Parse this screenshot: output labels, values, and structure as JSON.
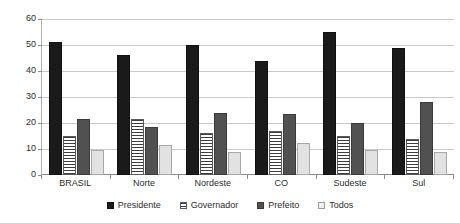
{
  "chart_data": {
    "type": "bar",
    "title": "",
    "subtitle": "",
    "xlabel": "",
    "ylabel": "",
    "ylim": [
      0,
      60
    ],
    "ytick_step": 10,
    "yticks": [
      0,
      10,
      20,
      30,
      40,
      50,
      60
    ],
    "ytick_labels": [
      "0",
      "10",
      "20",
      "30",
      "40",
      "50",
      "60"
    ],
    "grid": true,
    "grid_axis": "y",
    "legend_position": "bottom",
    "categories": [
      "BRASIL",
      "Norte",
      "Nordeste",
      "CO",
      "Sudeste",
      "Sul"
    ],
    "series": [
      {
        "name": "Presidente",
        "color": "#1a1a1a",
        "values": [
          51,
          46,
          50,
          44,
          55,
          49
        ]
      },
      {
        "name": "Governador",
        "color": "#ffffff",
        "pattern": "horizontal-stripes",
        "values": [
          15,
          21.5,
          16,
          17,
          15,
          14
        ]
      },
      {
        "name": "Prefeito",
        "color": "#515151",
        "values": [
          21.5,
          18.5,
          24,
          23.5,
          20,
          28
        ]
      },
      {
        "name": "Todos",
        "color": "#e2e2e2",
        "values": [
          9.5,
          11.5,
          9,
          12.5,
          9.5,
          9
        ]
      }
    ]
  },
  "legend": {
    "items": [
      {
        "label": "Presidente",
        "swatch": "presidente"
      },
      {
        "label": "Governador",
        "swatch": "governador"
      },
      {
        "label": "Prefeito",
        "swatch": "prefeito"
      },
      {
        "label": "Todos",
        "swatch": "todos"
      }
    ]
  }
}
